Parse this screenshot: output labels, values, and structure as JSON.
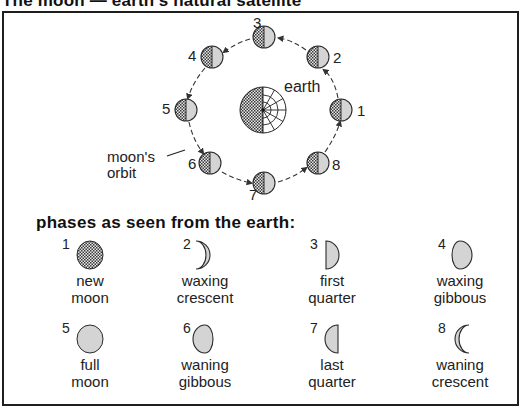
{
  "title": "The moon — earth's natural satellite",
  "orbit_diagram": {
    "earth_label": "earth",
    "orbit_label_line1": "moon's",
    "orbit_label_line2": "orbit",
    "positions": [
      {
        "num": "1",
        "x": 341,
        "y": 110
      },
      {
        "num": "2",
        "x": 318,
        "y": 57
      },
      {
        "num": "3",
        "x": 264,
        "y": 37
      },
      {
        "num": "4",
        "x": 212,
        "y": 57
      },
      {
        "num": "5",
        "x": 186,
        "y": 110
      },
      {
        "num": "6",
        "x": 210,
        "y": 163
      },
      {
        "num": "7",
        "x": 264,
        "y": 183
      },
      {
        "num": "8",
        "x": 318,
        "y": 163
      }
    ]
  },
  "phases_heading": "phases as seen from the earth:",
  "phases": [
    {
      "num": "1",
      "line1": "new",
      "line2": "moon",
      "shape": "new"
    },
    {
      "num": "2",
      "line1": "waxing",
      "line2": "crescent",
      "shape": "waxing-crescent"
    },
    {
      "num": "3",
      "line1": "first",
      "line2": "quarter",
      "shape": "first-quarter"
    },
    {
      "num": "4",
      "line1": "waxing",
      "line2": "gibbous",
      "shape": "waxing-gibbous"
    },
    {
      "num": "5",
      "line1": "full",
      "line2": "moon",
      "shape": "full"
    },
    {
      "num": "6",
      "line1": "waning",
      "line2": "gibbous",
      "shape": "waning-gibbous"
    },
    {
      "num": "7",
      "line1": "last",
      "line2": "quarter",
      "shape": "last-quarter"
    },
    {
      "num": "8",
      "line1": "waning",
      "line2": "crescent",
      "shape": "waning-crescent"
    }
  ],
  "colors": {
    "lit": "#d4d4d4",
    "dark_hatch": "#555555",
    "outline": "#2a2a2a"
  }
}
